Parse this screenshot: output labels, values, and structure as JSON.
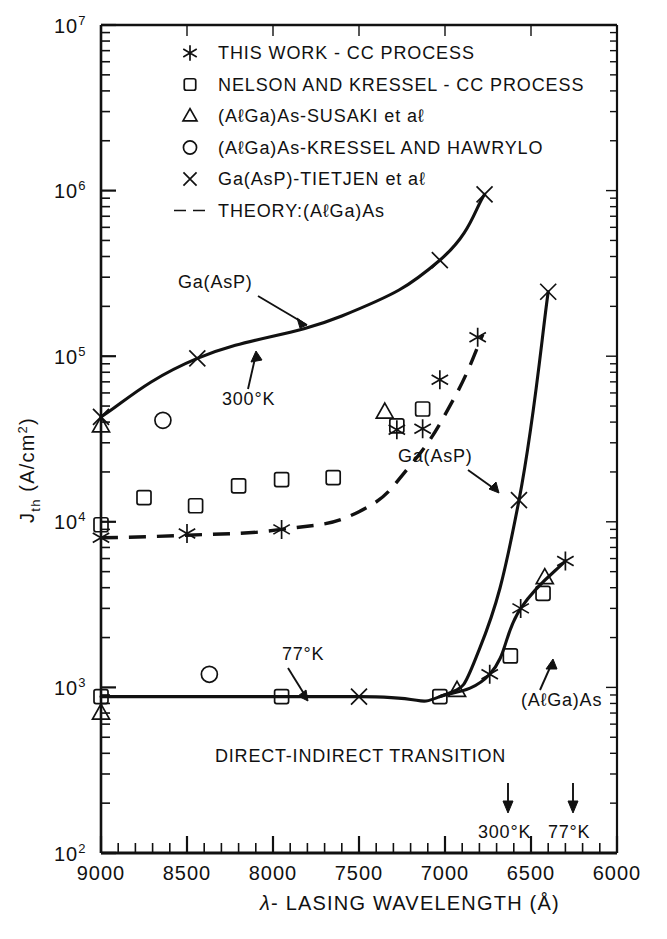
{
  "chart_data": {
    "type": "scatter",
    "title": "",
    "xlabel": "λ - LASING WAVELENGTH (Å)",
    "ylabel": "J_th (A/cm2)",
    "ylabel_main": "J",
    "ylabel_sub": "th",
    "ylabel_unit": "(A/cm",
    "ylabel_unit_sup": "2",
    "ylabel_unit_close": ")",
    "xlim": [
      9000,
      6000
    ],
    "xaxis_reversed": true,
    "xscale": "linear",
    "yscale": "log",
    "ylim": [
      100,
      10000000
    ],
    "grid": false,
    "legend_position": "upper-left-inside",
    "xticks": [
      9000,
      8500,
      8000,
      7500,
      7000,
      6500,
      6000
    ],
    "xticklabels": [
      "9000",
      "8500",
      "8000",
      "7500",
      "7000",
      "6500",
      "6000"
    ],
    "xtick_minor_step": 100,
    "yticks": [
      100,
      1000,
      10000,
      100000,
      1000000,
      10000000
    ],
    "yticklabels": [
      "10^2",
      "10^3",
      "10^4",
      "10^5",
      "10^6",
      "10^7"
    ],
    "ytick_base": "10",
    "ytick_exponents": [
      "2",
      "3",
      "4",
      "5",
      "6",
      "7"
    ],
    "series": [
      {
        "name": "THIS WORK - CC PROCESS",
        "marker": "asterisk",
        "points": [
          {
            "x": 9000,
            "y": 8000
          },
          {
            "x": 8500,
            "y": 8500
          },
          {
            "x": 7950,
            "y": 9000
          },
          {
            "x": 7280,
            "y": 36000
          },
          {
            "x": 7130,
            "y": 36500
          },
          {
            "x": 7030,
            "y": 72000
          },
          {
            "x": 6810,
            "y": 130000
          },
          {
            "x": 6560,
            "y": 3000
          },
          {
            "x": 6740,
            "y": 1200
          },
          {
            "x": 6300,
            "y": 5800
          }
        ]
      },
      {
        "name": "NELSON AND KRESSEL - CC PROCESS",
        "marker": "square",
        "points": [
          {
            "x": 9000,
            "y": 9600
          },
          {
            "x": 8750,
            "y": 14000
          },
          {
            "x": 8450,
            "y": 12500
          },
          {
            "x": 8200,
            "y": 16500
          },
          {
            "x": 7950,
            "y": 18000
          },
          {
            "x": 7650,
            "y": 18500
          },
          {
            "x": 7280,
            "y": 38000
          },
          {
            "x": 7130,
            "y": 48000
          },
          {
            "x": 9000,
            "y": 880
          },
          {
            "x": 7950,
            "y": 880
          },
          {
            "x": 7030,
            "y": 880
          },
          {
            "x": 6620,
            "y": 1550
          },
          {
            "x": 6430,
            "y": 3700
          }
        ]
      },
      {
        "name": "(AlGa)As - SUSAKI et al",
        "marker": "triangle",
        "points": [
          {
            "x": 9000,
            "y": 38000
          },
          {
            "x": 7350,
            "y": 46000
          },
          {
            "x": 9000,
            "y": 700
          },
          {
            "x": 6930,
            "y": 960
          },
          {
            "x": 6420,
            "y": 4600
          }
        ]
      },
      {
        "name": "(AlGa)As - KRESSEL AND HAWRYLO",
        "marker": "circle",
        "points": [
          {
            "x": 8640,
            "y": 41000
          },
          {
            "x": 8370,
            "y": 1200
          }
        ]
      },
      {
        "name": "Ga(AsP) - TIETJEN et al",
        "marker": "cross",
        "points": [
          {
            "x": 9000,
            "y": 43000
          },
          {
            "x": 8440,
            "y": 97000
          },
          {
            "x": 7030,
            "y": 380000
          },
          {
            "x": 6770,
            "y": 950000
          },
          {
            "x": 7500,
            "y": 880
          },
          {
            "x": 6570,
            "y": 13500
          },
          {
            "x": 6400,
            "y": 245000
          }
        ]
      }
    ],
    "curves": [
      {
        "name": "Ga(AsP) 300K",
        "style": "solid",
        "points": [
          [
            9000,
            43000
          ],
          [
            8440,
            97000
          ],
          [
            7600,
            175000
          ],
          [
            7030,
            380000
          ],
          [
            6770,
            950000
          ]
        ]
      },
      {
        "name": "theory (AlGa)As",
        "style": "dashed",
        "points": [
          [
            9000,
            8000
          ],
          [
            8500,
            8300
          ],
          [
            7950,
            9000
          ],
          [
            7500,
            11500
          ],
          [
            7200,
            22000
          ],
          [
            6950,
            55000
          ],
          [
            6780,
            135000
          ]
        ]
      },
      {
        "name": "Ga(AsP) 77K",
        "style": "solid",
        "points": [
          [
            9000,
            880
          ],
          [
            7500,
            880
          ],
          [
            7030,
            880
          ],
          [
            6800,
            1700
          ],
          [
            6570,
            13500
          ],
          [
            6400,
            245000
          ]
        ]
      },
      {
        "name": "(AlGa)As 77K",
        "style": "solid",
        "points": [
          [
            7030,
            880
          ],
          [
            6740,
            1200
          ],
          [
            6560,
            3000
          ],
          [
            6300,
            5800
          ]
        ]
      }
    ],
    "annotations": [
      {
        "text": "Ga(AsP)",
        "role": "curve-label-300k"
      },
      {
        "text": "300°K",
        "role": "temperature-label-upper"
      },
      {
        "text": "77°K",
        "role": "temperature-label-lower"
      },
      {
        "text": "Ga(AsP)",
        "role": "curve-label-77k"
      },
      {
        "text": "(AℓGa)As",
        "role": "curve-label-algaas"
      },
      {
        "text": "DIRECT-INDIRECT TRANSITION",
        "role": "transition-caption"
      },
      {
        "text": "300°K",
        "role": "transition-marker-300k"
      },
      {
        "text": "77°K",
        "role": "transition-marker-77k"
      }
    ]
  },
  "legend": {
    "items": [
      {
        "marker": "asterisk",
        "label": "THIS WORK - CC PROCESS"
      },
      {
        "marker": "square",
        "label": "NELSON AND KRESSEL - CC PROCESS"
      },
      {
        "marker": "triangle",
        "label": "(AℓGa)As-SUSAKI et aℓ"
      },
      {
        "marker": "circle",
        "label": "(AℓGa)As-KRESSEL AND HAWRYLO"
      },
      {
        "marker": "cross",
        "label": "Ga(AsP)-TIETJEN et aℓ"
      },
      {
        "marker": "dashed",
        "label": "THEORY:(AℓGa)As"
      }
    ]
  },
  "axes": {
    "x_title": "λ- LASING WAVELENGTH (Å)",
    "x_lambda": "λ",
    "x_rest": "- LASING WAVELENGTH (Å)",
    "y_title_main": "J",
    "y_title_sub": "th",
    "y_title_unit": "(A/cm",
    "y_title_sup": "2",
    "y_title_close": ")",
    "xticklabels": [
      "9000",
      "8500",
      "8000",
      "7500",
      "7000",
      "6500",
      "6000"
    ],
    "ytick_base": "10",
    "ytick_exponents": [
      "7",
      "6",
      "5",
      "4",
      "3",
      "2"
    ]
  },
  "colors": {
    "ink": "#111111",
    "background": "#ffffff"
  }
}
